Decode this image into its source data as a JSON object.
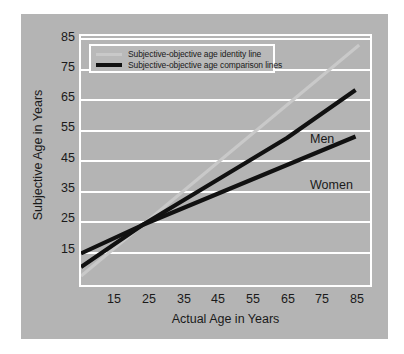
{
  "chart_data": {
    "type": "line",
    "title": "",
    "xlabel": "Actual Age in Years",
    "ylabel": "Subjective Age in Years",
    "xlim": [
      8,
      88
    ],
    "ylim": [
      5,
      88
    ],
    "xticks": [
      15,
      25,
      35,
      45,
      55,
      65,
      75,
      85
    ],
    "yticks": [
      15,
      25,
      35,
      45,
      55,
      65,
      75,
      85
    ],
    "grid": "horizontal",
    "legend_position": "top-left inside axes",
    "series": [
      {
        "name": "Subjective-objective age identity line",
        "color": "#c9c9c9",
        "linewidth": 3,
        "x": [
          8,
          85
        ],
        "y": [
          8,
          85
        ]
      },
      {
        "name": "Men",
        "legend_group": "Subjective-objective age comparison lines",
        "color": "#111111",
        "linewidth": 4,
        "x": [
          8,
          25,
          45,
          65,
          84
        ],
        "y": [
          11,
          25,
          39.5,
          54,
          70
        ]
      },
      {
        "name": "Women",
        "legend_group": "Subjective-objective age comparison lines",
        "color": "#111111",
        "linewidth": 4,
        "x": [
          8,
          25,
          45,
          65,
          84
        ],
        "y": [
          15.5,
          25,
          35,
          45,
          54.5
        ]
      }
    ],
    "annotations": [
      {
        "text": "Men",
        "x": 72,
        "y": 62
      },
      {
        "text": "Women",
        "x": 72,
        "y": 47
      }
    ]
  },
  "legend": {
    "entries": [
      {
        "label": "Subjective-objective age identity line",
        "swatch": "identity"
      },
      {
        "label": "Subjective-objective age comparison lines",
        "swatch": "comparison"
      }
    ]
  },
  "axes": {
    "x_label": "Actual Age in Years",
    "y_label": "Subjective Age in Years",
    "x_ticks": [
      "15",
      "25",
      "35",
      "45",
      "55",
      "65",
      "75",
      "85"
    ],
    "y_ticks": [
      "85",
      "75",
      "65",
      "55",
      "45",
      "35",
      "25",
      "15"
    ]
  },
  "annotations": {
    "men": "Men",
    "women": "Women"
  },
  "colors": {
    "panel_background": "#b4b4b4",
    "page_background": "#ffffff",
    "gridline": "#ffffff",
    "identity_line": "#c9c9c9",
    "comparison_line": "#111111",
    "text": "#1a1a1a"
  }
}
